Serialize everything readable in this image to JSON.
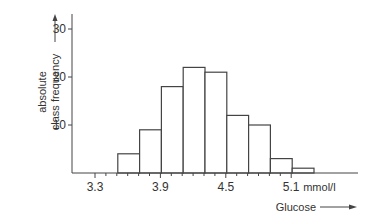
{
  "chart_data": {
    "type": "bar",
    "subtype": "histogram",
    "title": "",
    "xlabel": "Glucose",
    "ylabel": "absolute class frequency",
    "x_unit": "mmol/l",
    "bins": [
      {
        "from": 3.5,
        "to": 3.7,
        "value": 4
      },
      {
        "from": 3.7,
        "to": 3.9,
        "value": 9
      },
      {
        "from": 3.9,
        "to": 4.1,
        "value": 18
      },
      {
        "from": 4.1,
        "to": 4.3,
        "value": 22
      },
      {
        "from": 4.3,
        "to": 4.5,
        "value": 21
      },
      {
        "from": 4.5,
        "to": 4.7,
        "value": 12
      },
      {
        "from": 4.7,
        "to": 4.9,
        "value": 10
      },
      {
        "from": 4.9,
        "to": 5.1,
        "value": 3
      },
      {
        "from": 5.1,
        "to": 5.3,
        "value": 1
      }
    ],
    "categories": [
      "3.5-3.7",
      "3.7-3.9",
      "3.9-4.1",
      "4.1-4.3",
      "4.3-4.5",
      "4.5-4.7",
      "4.7-4.9",
      "4.9-5.1",
      "5.1-5.3"
    ],
    "values": [
      4,
      9,
      18,
      22,
      21,
      12,
      10,
      3,
      1
    ],
    "x_ticks": [
      3.3,
      3.9,
      4.5,
      5.1
    ],
    "x_tick_labels": [
      "3.3",
      "3.9",
      "4.5",
      "5.1"
    ],
    "y_ticks": [
      10,
      20,
      30
    ],
    "y_tick_labels": [
      "10",
      "20",
      "30"
    ],
    "xlim": [
      3.1,
      5.7
    ],
    "ylim": [
      0,
      33
    ],
    "grid": false,
    "legend": null
  },
  "labels": {
    "y_line1": "absolute",
    "y_line2": "class frequency",
    "x_axis": "Glucose",
    "x_unit": "mmol/l"
  },
  "colors": {
    "line": "#444444",
    "bar_fill": "#ffffff",
    "text": "#333333"
  }
}
